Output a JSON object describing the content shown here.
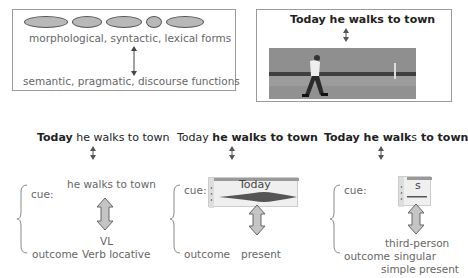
{
  "top_left_panel": {
    "forms_label": "morphological, syntactic, lexical forms",
    "functions_label": "semantic, pragmatic, discourse functions",
    "ellipse_count": 5
  },
  "top_right_panel": {
    "sentence": "Today he walks to town",
    "image_description": "man walking in a field"
  },
  "columns": [
    {
      "sentence_parts": [
        {
          "text": "Today",
          "bold": true
        },
        {
          "text": " he walks to town",
          "bold": false
        }
      ],
      "cue_label": "cue:",
      "cue_content": "he walks to town",
      "outcome_label": "outcome",
      "outcome_lines": [
        "VL",
        "Verb locative"
      ]
    },
    {
      "sentence_parts": [
        {
          "text": "Today ",
          "bold": false
        },
        {
          "text": "he walks to town",
          "bold": true
        }
      ],
      "cue_label": "cue:",
      "cue_content": "Today",
      "outcome_label": "outcome",
      "outcome_lines": [
        "present"
      ]
    },
    {
      "sentence_parts": [
        {
          "text": "Today he walk",
          "bold": true
        },
        {
          "text": "s",
          "bold": false
        },
        {
          "text": " to town",
          "bold": true
        }
      ],
      "cue_label": "cue:",
      "cue_content": "s",
      "outcome_label": "outcome",
      "outcome_lines": [
        "third-person",
        "singular",
        "simple present"
      ]
    }
  ]
}
